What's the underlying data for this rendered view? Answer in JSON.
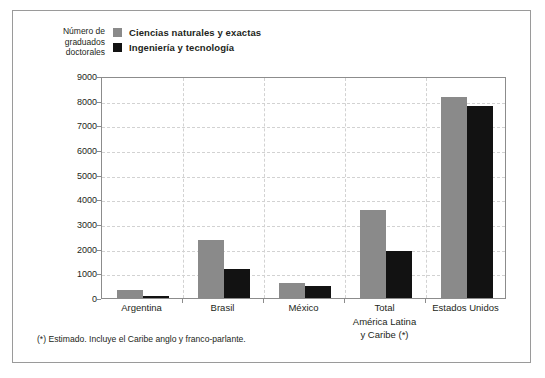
{
  "chart_data": {
    "type": "bar",
    "title": "",
    "subtitle": "",
    "xlabel": "",
    "ylabel": "Número de\ngraduados\ndoctorales",
    "ylim": [
      0,
      9000
    ],
    "ystep": 1000,
    "yticks": [
      0,
      1000,
      2000,
      3000,
      4000,
      5000,
      6000,
      7000,
      8000,
      9000
    ],
    "ytick_labels": [
      "0",
      "1000",
      "2000",
      "3000",
      "4000",
      "5000",
      "6000",
      "7000",
      "8000",
      "9000"
    ],
    "grid": true,
    "grid_style": "dashed",
    "legend_position": "top-left",
    "categories": [
      "Argentina",
      "Brasil",
      "México",
      "Total\nAmérica Latina\ny Caribe (*)",
      "Estados Unidos"
    ],
    "series": [
      {
        "name": "Ciencias naturales y exactas",
        "color": "#8a8a8a",
        "values": [
          310,
          2350,
          620,
          3560,
          8160
        ]
      },
      {
        "name": "Ingeniería y tecnología",
        "color": "#121212",
        "values": [
          90,
          1180,
          480,
          1900,
          7800
        ]
      }
    ],
    "annotations": [
      "(*) Estimado. Incluye el Caribe anglo y franco-parlante."
    ]
  },
  "legend": {
    "items": [
      {
        "label": "Ciencias naturales y exactas",
        "color": "#8a8a8a"
      },
      {
        "label": "Ingeniería y tecnología",
        "color": "#121212"
      }
    ]
  },
  "axis": {
    "y_title": "Número de\ngraduados\ndoctorales"
  },
  "footnote": {
    "text": "(*) Estimado. Incluye el Caribe anglo y franco-parlante."
  },
  "colors": {
    "series_natural_sciences": "#8a8a8a",
    "series_engineering": "#121212",
    "grid": "#d2d2d2",
    "axis": "#8c8c8c",
    "text": "#231f20",
    "frame": "#9a9a9a"
  }
}
